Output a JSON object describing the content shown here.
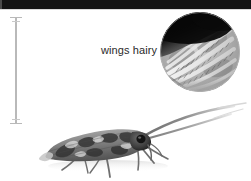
{
  "figure": {
    "background_color": "#ffffff",
    "width": 251,
    "height": 181,
    "top_bar": {
      "name": "top-black-band",
      "color": "#131313",
      "height_px": 9
    },
    "scale_bar": {
      "name": "vertical-scale-bar",
      "color": "#b9b9b9",
      "top_y": 17,
      "bottom_y": 123,
      "x": 16
    },
    "callout": {
      "label": "wings hairy",
      "color": "#2a2a2a",
      "x": 101,
      "y": 44
    },
    "inset": {
      "name": "magnified-wing-circle",
      "caption_ref": "wings hairy",
      "center_x": 200,
      "center_y": 52,
      "diameter": 80,
      "dark_corner_color": "#0a0a0a",
      "mid_tone_color": "#9a9a9a",
      "highlight_color": "#f2f2f2",
      "bottom_arc_color": "#a8a8a8",
      "description": "magnified caddisfly wing showing hair-fringed veins"
    },
    "specimen": {
      "name": "caddisfly-adult",
      "order": "Trichoptera",
      "body_color_dark": "#3a3a3a",
      "body_color_mid": "#8d8d8d",
      "body_color_light": "#d6d6d6",
      "antenna_color": "#8e8e8e",
      "orientation": "facing-right",
      "description": "adult caddisfly in lateral view with mottled tent-shaped wings and long forward-sweeping antennae"
    }
  }
}
